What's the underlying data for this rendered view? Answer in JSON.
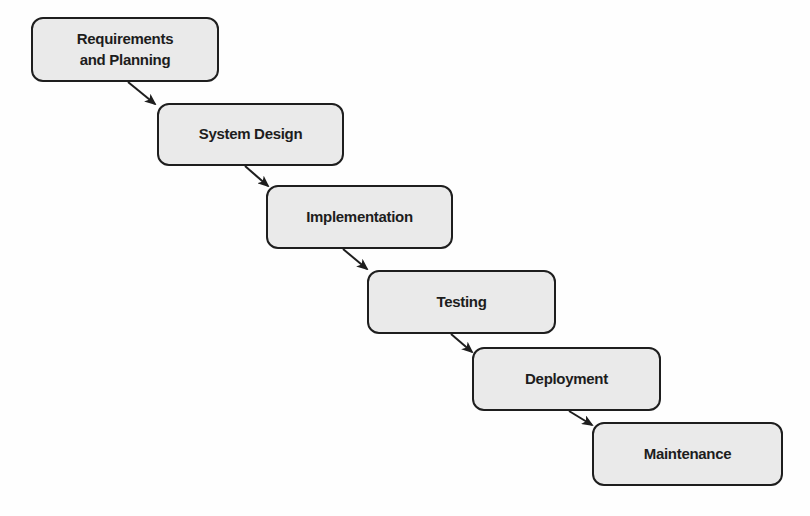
{
  "diagram": {
    "type": "waterfall-process",
    "steps": [
      {
        "label": "Requirements\nand Planning"
      },
      {
        "label": "System Design"
      },
      {
        "label": "Implementation"
      },
      {
        "label": "Testing"
      },
      {
        "label": "Deployment"
      },
      {
        "label": "Maintenance"
      }
    ],
    "connections": [
      {
        "from": "Requirements and Planning",
        "to": "System Design"
      },
      {
        "from": "System Design",
        "to": "Implementation"
      },
      {
        "from": "Implementation",
        "to": "Testing"
      },
      {
        "from": "Testing",
        "to": "Deployment"
      },
      {
        "from": "Deployment",
        "to": "Maintenance"
      }
    ],
    "colors": {
      "box_fill": "#eaeaea",
      "box_border": "#1e1e1e",
      "arrow": "#1e1e1e",
      "background": "#fefefe"
    }
  }
}
